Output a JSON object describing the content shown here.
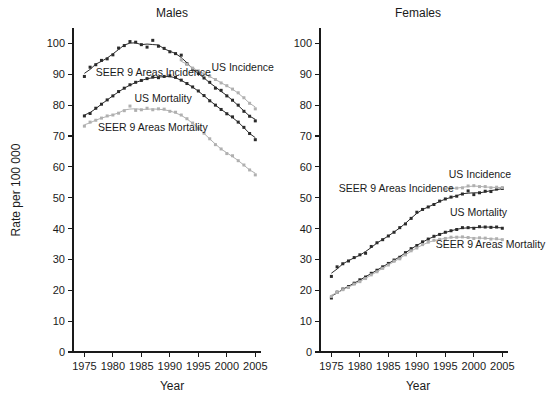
{
  "figure": {
    "background": "#ffffff",
    "width": 552,
    "height": 411
  },
  "axis_titles": {
    "x": "Year",
    "y": "Rate per 100 000"
  },
  "colors": {
    "dark": "#2b2b2b",
    "light": "#b0b0b0",
    "axis": "#1a1a1a",
    "text": "#1a1a1a"
  },
  "chart_data": [
    {
      "type": "line",
      "title": "Males",
      "xlabel": "Year",
      "ylabel": "Rate per 100 000",
      "xlim": [
        1973,
        2006
      ],
      "ylim": [
        0,
        105
      ],
      "xticks": [
        1975,
        1980,
        1985,
        1990,
        1995,
        2000,
        2005
      ],
      "yticks": [
        0,
        10,
        20,
        30,
        40,
        50,
        60,
        70,
        80,
        90,
        100
      ],
      "grid": false,
      "legend": "inline-annotations",
      "annotations": [
        {
          "text": "SEER 9 Areas Incidence",
          "x": 1977.0,
          "y": 89.5
        },
        {
          "text": "US Incidence",
          "x": 1997.3,
          "y": 91.0
        },
        {
          "text": "US Mortality",
          "x": 1983.8,
          "y": 81.0
        },
        {
          "text": "SEER 9 Areas Mortality",
          "x": 1977.4,
          "y": 71.5
        }
      ],
      "series": [
        {
          "name": "SEER 9 Areas Incidence",
          "color": "#2b2b2b",
          "x": [
            1975,
            1976,
            1977,
            1978,
            1979,
            1980,
            1981,
            1982,
            1983,
            1984,
            1985,
            1986,
            1987,
            1988,
            1989,
            1990,
            1991,
            1992,
            1993,
            1994,
            1995,
            1996,
            1997,
            1998,
            1999,
            2000,
            2001,
            2002,
            2003,
            2004,
            2005
          ],
          "values": [
            89.3,
            92.3,
            93.1,
            94.5,
            95.0,
            96.3,
            98.5,
            99.3,
            100.6,
            100.4,
            99.6,
            98.8,
            101.0,
            99.1,
            98.4,
            97.3,
            96.7,
            96.2,
            93.4,
            91.6,
            90.3,
            88.8,
            87.4,
            85.5,
            84.8,
            83.0,
            81.6,
            80.0,
            78.0,
            76.4,
            74.9
          ],
          "marker": "square"
        },
        {
          "name": "US Incidence",
          "color": "#b0b0b0",
          "x": [
            1992,
            1993,
            1994,
            1995,
            1996,
            1997,
            1998,
            1999,
            2000,
            2001,
            2002,
            2003,
            2004,
            2005
          ],
          "values": [
            94.7,
            93.2,
            92.0,
            91.1,
            90.1,
            89.4,
            88.3,
            87.2,
            86.3,
            85.2,
            84.0,
            82.4,
            80.6,
            78.8
          ],
          "marker": "square"
        },
        {
          "name": "US Mortality",
          "color": "#2b2b2b",
          "x": [
            1975,
            1976,
            1977,
            1978,
            1979,
            1980,
            1981,
            1982,
            1983,
            1984,
            1985,
            1986,
            1987,
            1988,
            1989,
            1990,
            1991,
            1992,
            1993,
            1994,
            1995,
            1996,
            1997,
            1998,
            1999,
            2000,
            2001,
            2002,
            2003,
            2004,
            2005
          ],
          "values": [
            76.5,
            77.3,
            79.0,
            80.3,
            81.7,
            83.0,
            84.4,
            85.5,
            86.6,
            87.4,
            88.0,
            88.6,
            89.1,
            88.9,
            89.3,
            89.5,
            89.0,
            88.1,
            87.0,
            85.9,
            84.6,
            83.1,
            81.4,
            80.0,
            78.6,
            77.2,
            76.2,
            74.5,
            72.8,
            70.8,
            68.8
          ],
          "marker": "square"
        },
        {
          "name": "SEER 9 Areas Mortality",
          "color": "#b0b0b0",
          "x": [
            1975,
            1976,
            1977,
            1978,
            1979,
            1980,
            1981,
            1982,
            1983,
            1984,
            1985,
            1986,
            1987,
            1988,
            1989,
            1990,
            1991,
            1992,
            1993,
            1994,
            1995,
            1996,
            1997,
            1998,
            1999,
            2000,
            2001,
            2002,
            2003,
            2004,
            2005
          ],
          "values": [
            73.2,
            74.5,
            75.1,
            75.8,
            76.5,
            76.8,
            77.4,
            78.2,
            79.7,
            78.3,
            78.5,
            79.0,
            78.5,
            78.8,
            78.7,
            78.0,
            77.7,
            76.8,
            75.6,
            74.2,
            72.5,
            70.9,
            69.1,
            67.2,
            65.8,
            64.3,
            63.6,
            62.0,
            60.6,
            59.0,
            57.4
          ],
          "marker": "square"
        }
      ]
    },
    {
      "type": "line",
      "title": "Females",
      "xlabel": "Year",
      "ylabel": "Rate per 100 000",
      "xlim": [
        1973,
        2006
      ],
      "ylim": [
        0,
        105
      ],
      "xticks": [
        1975,
        1980,
        1985,
        1990,
        1995,
        2000,
        2005
      ],
      "yticks": [
        0,
        10,
        20,
        30,
        40,
        50,
        60,
        70,
        80,
        90,
        100
      ],
      "grid": false,
      "legend": "inline-annotations",
      "annotations": [
        {
          "text": "SEER 9 Areas Incidence",
          "x": 1976.3,
          "y": 52.0
        },
        {
          "text": "US Incidence",
          "x": 1995.6,
          "y": 56.5
        },
        {
          "text": "US Mortality",
          "x": 1995.8,
          "y": 44.0
        },
        {
          "text": "SEER 9 Areas Mortality",
          "x": 1993.3,
          "y": 33.6
        }
      ],
      "series": [
        {
          "name": "SEER 9 Areas Incidence",
          "color": "#2b2b2b",
          "x": [
            1975,
            1976,
            1977,
            1978,
            1979,
            1980,
            1981,
            1982,
            1983,
            1984,
            1985,
            1986,
            1987,
            1988,
            1989,
            1990,
            1991,
            1992,
            1993,
            1994,
            1995,
            1996,
            1997,
            1998,
            1999,
            2000,
            2001,
            2002,
            2003,
            2004,
            2005
          ],
          "values": [
            24.5,
            27.6,
            28.6,
            29.5,
            30.6,
            31.5,
            32.0,
            34.2,
            35.4,
            36.4,
            37.6,
            38.8,
            40.3,
            41.5,
            43.3,
            45.3,
            46.2,
            47.0,
            47.8,
            48.9,
            49.6,
            50.2,
            50.5,
            51.2,
            52.2,
            51.0,
            51.6,
            52.1,
            52.0,
            52.8,
            53.0
          ],
          "marker": "square"
        },
        {
          "name": "US Incidence",
          "color": "#b0b0b0",
          "x": [
            1995,
            1996,
            1997,
            1998,
            1999,
            2000,
            2001,
            2002,
            2003,
            2004,
            2005
          ],
          "values": [
            52.8,
            53.0,
            53.1,
            53.2,
            53.8,
            53.9,
            53.6,
            53.6,
            53.2,
            53.4,
            53.3
          ],
          "marker": "square"
        },
        {
          "name": "US Mortality",
          "color": "#2b2b2b",
          "x": [
            1975,
            1976,
            1977,
            1978,
            1979,
            1980,
            1981,
            1982,
            1983,
            1984,
            1985,
            1986,
            1987,
            1988,
            1989,
            1990,
            1991,
            1992,
            1993,
            1994,
            1995,
            1996,
            1997,
            1998,
            1999,
            2000,
            2001,
            2002,
            2003,
            2004,
            2005
          ],
          "values": [
            17.5,
            19.4,
            20.4,
            21.2,
            22.3,
            23.4,
            24.3,
            25.5,
            26.5,
            27.6,
            28.7,
            29.8,
            30.7,
            32.2,
            33.5,
            34.5,
            35.7,
            36.6,
            37.5,
            38.1,
            38.8,
            39.3,
            39.7,
            40.3,
            40.3,
            40.1,
            40.6,
            40.5,
            40.4,
            40.5,
            40.1
          ],
          "marker": "square"
        },
        {
          "name": "SEER 9 Areas Mortality",
          "color": "#b0b0b0",
          "x": [
            1975,
            1976,
            1977,
            1978,
            1979,
            1980,
            1981,
            1982,
            1983,
            1984,
            1985,
            1986,
            1987,
            1988,
            1989,
            1990,
            1991,
            1992,
            1993,
            1994,
            1995,
            1996,
            1997,
            1998,
            1999,
            2000,
            2001,
            2002,
            2003,
            2004,
            2005
          ],
          "values": [
            18.0,
            19.3,
            20.2,
            20.9,
            22.0,
            22.8,
            23.8,
            25.0,
            26.0,
            27.1,
            28.2,
            29.4,
            30.2,
            31.5,
            32.8,
            33.7,
            34.8,
            35.6,
            36.2,
            36.5,
            36.8,
            37.2,
            37.2,
            37.3,
            37.1,
            36.8,
            37.0,
            36.9,
            36.6,
            36.7,
            36.4
          ],
          "marker": "square"
        }
      ]
    }
  ]
}
